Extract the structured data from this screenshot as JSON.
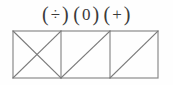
{
  "symbols": {
    "open_paren": "(",
    "close_paren": ")",
    "groups": [
      {
        "name": "division",
        "glyph": "÷",
        "label": "(÷)"
      },
      {
        "name": "zero",
        "glyph": "0",
        "label": "(0)"
      },
      {
        "name": "plus",
        "glyph": "+",
        "label": "(+)"
      }
    ]
  },
  "figure": {
    "type": "square-grid-with-diagonals",
    "square_count": 3,
    "geometry": {
      "x0": 13,
      "y0": 5,
      "x1": 158,
      "y1": 52,
      "dividers": [
        61,
        110
      ]
    },
    "squares": [
      {
        "index": 1,
        "diagonals": [
          "tl-br",
          "bl-tr"
        ],
        "description": "both diagonals forming an X"
      },
      {
        "index": 2,
        "diagonals": [
          "bl-tr"
        ],
        "description": "single diagonal bottom-left to top-right"
      },
      {
        "index": 3,
        "diagonals": [
          "bl-tr"
        ],
        "description": "single diagonal bottom-left to top-right"
      }
    ]
  },
  "colors": {
    "background": "#fefefe",
    "line": "#8a8a8a",
    "line_dark": "#6e6e6e",
    "text": "#3a3a3a"
  }
}
